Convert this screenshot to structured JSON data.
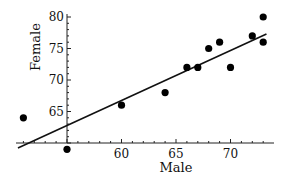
{
  "chart_data": {
    "type": "scatter",
    "title": "",
    "xlabel": "Male",
    "ylabel": "Female",
    "xlim": [
      50.5,
      73.5
    ],
    "ylim": [
      59,
      81
    ],
    "x_ticks": [
      "60",
      "65",
      "70"
    ],
    "y_ticks": [
      "65",
      "70",
      "75",
      "80"
    ],
    "grid": false,
    "legend": null,
    "points": [
      {
        "x": 51,
        "y": 64
      },
      {
        "x": 55,
        "y": 59
      },
      {
        "x": 60,
        "y": 66
      },
      {
        "x": 64,
        "y": 68
      },
      {
        "x": 66,
        "y": 72
      },
      {
        "x": 67,
        "y": 72
      },
      {
        "x": 68,
        "y": 75
      },
      {
        "x": 69,
        "y": 76
      },
      {
        "x": 70,
        "y": 72
      },
      {
        "x": 72,
        "y": 77
      },
      {
        "x": 73,
        "y": 80
      },
      {
        "x": 73,
        "y": 76
      }
    ],
    "regression_line": {
      "x1": 50.5,
      "y1": 59.2,
      "x2": 73.3,
      "y2": 77.3
    }
  }
}
